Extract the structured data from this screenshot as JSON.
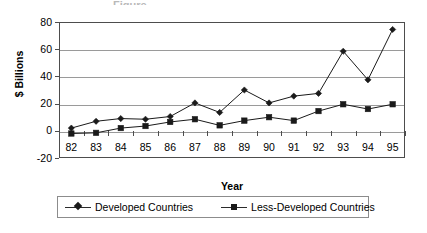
{
  "chart_data": {
    "type": "line",
    "title": "",
    "title_remnant": "Figure",
    "xlabel": "Year",
    "ylabel": "$ Billions",
    "categories": [
      "82",
      "83",
      "84",
      "85",
      "86",
      "87",
      "88",
      "89",
      "90",
      "91",
      "92",
      "93",
      "94",
      "95"
    ],
    "ylim": [
      -20,
      80
    ],
    "yticks": [
      "80",
      "60",
      "40",
      "20",
      "0",
      "-20"
    ],
    "ytick_values": [
      80,
      60,
      40,
      20,
      0,
      -20
    ],
    "grid": true,
    "legend_position": "bottom",
    "series": [
      {
        "name": "Developed Countries",
        "marker": "diamond",
        "color": "#1a1a1a",
        "values": [
          2,
          7,
          9,
          8.5,
          10.5,
          20.5,
          13.5,
          30,
          20.5,
          25.5,
          27.5,
          58.5,
          37.5,
          74.5
        ]
      },
      {
        "name": "Less-Developed Countries",
        "marker": "square",
        "color": "#1a1a1a",
        "values": [
          -2,
          -1.5,
          2,
          3.5,
          6.5,
          8.5,
          4,
          7.5,
          10,
          7.5,
          14.5,
          19.5,
          16,
          19.5
        ]
      }
    ]
  },
  "legend": {
    "items": [
      {
        "label": "Developed Countries",
        "marker": "diamond"
      },
      {
        "label": "Less-Developed Countries",
        "marker": "square"
      }
    ]
  }
}
